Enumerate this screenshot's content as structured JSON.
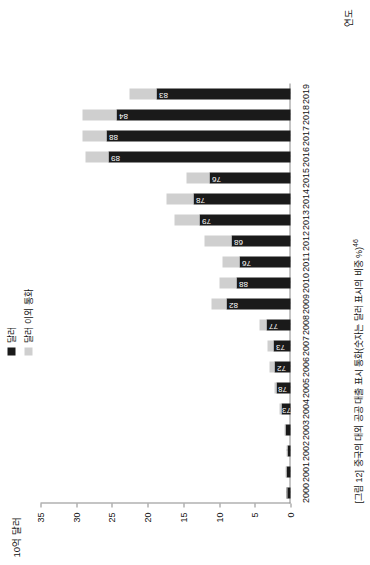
{
  "caption": "[그림 12] 중국의 대외 공공 대출 표시 통화(숫자는 달러 표시의 비중 %)",
  "caption_sup": "46",
  "legend": {
    "dollar_label": "달러",
    "other_label": "달러 이외 통화",
    "dollar_color": "#1a1a1a",
    "other_color": "#cfcfcf"
  },
  "chart_data": {
    "type": "bar",
    "title": "[그림 12] 중국의 대외 공공 대출 표시 통화(숫자는 달러 표시의 비중 %)",
    "xlabel": "연도",
    "ylabel": "10억 달러",
    "ylim": [
      0,
      35
    ],
    "yticks": [
      "0",
      "5",
      "10",
      "15",
      "20",
      "25",
      "30",
      "35"
    ],
    "grid": false,
    "legend_position": "top-left",
    "stacked": true,
    "categories": [
      "2000",
      "2001",
      "2002",
      "2003",
      "2004",
      "2005",
      "2006",
      "2007",
      "2008",
      "2009",
      "2010",
      "2011",
      "2012",
      "2013",
      "2014",
      "2015",
      "2016",
      "2017",
      "2018",
      "2019"
    ],
    "series": [
      {
        "name": "달러",
        "color": "#1a1a1a",
        "values": [
          0.5,
          0.6,
          0.4,
          0.7,
          1.2,
          2.0,
          2.2,
          2.4,
          3.4,
          9.0,
          7.5,
          7.2,
          8.2,
          12.8,
          13.6,
          11.3,
          25.5,
          25.8,
          24.4,
          18.7
        ]
      },
      {
        "name": "달러 이외 통화",
        "color": "#cfcfcf",
        "values": [
          0.1,
          0.1,
          0.2,
          0.2,
          0.3,
          0.3,
          0.8,
          0.8,
          1.0,
          2.0,
          2.4,
          2.3,
          3.9,
          3.4,
          3.8,
          3.2,
          3.2,
          3.3,
          4.7,
          3.8
        ]
      }
    ],
    "data_labels": {
      "2000": "",
      "2001": "",
      "2002": "",
      "2003": "",
      "2004": "73",
      "2005": "78",
      "2006": "72",
      "2007": "73",
      "2008": "77",
      "2009": "82",
      "2010": "88",
      "2011": "76",
      "2012": "68",
      "2013": "79",
      "2014": "78",
      "2015": "76",
      "2016": "89",
      "2017": "88",
      "2018": "84",
      "2019": "83"
    }
  }
}
